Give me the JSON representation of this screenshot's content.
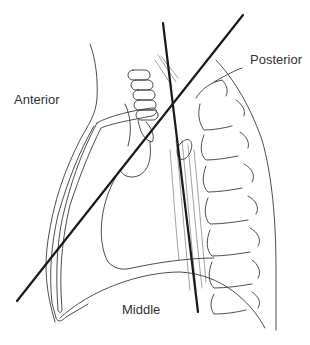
{
  "diagram": {
    "labels": {
      "anterior": "Anterior",
      "posterior": "Posterior",
      "middle": "Middle"
    },
    "dividing_lines": [
      {
        "name": "oblique-divider",
        "from": [
          17,
          301
        ],
        "to": [
          243,
          15
        ]
      },
      {
        "name": "vertical-divider",
        "from": [
          163,
          23
        ],
        "to": [
          198,
          312
        ]
      }
    ],
    "colors": {
      "line": "#1a1a1a",
      "outline": "#3a3a3a",
      "text": "#333333",
      "background": "#ffffff"
    }
  }
}
